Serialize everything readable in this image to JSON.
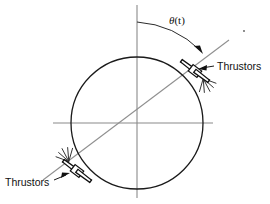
{
  "figure": {
    "type": "engineering-diagram"
  },
  "labels": {
    "angle_symbol": "θ",
    "angle_arg": "(t)",
    "angle_full": "θ(t)",
    "thruster_upper_right": "Thrustors",
    "thruster_lower_left": "Thrustors"
  },
  "colors": {
    "outline": "#111111",
    "axis": "#8a8a8a",
    "body_axis": "#8f8f8f",
    "background": "#ffffff",
    "arc": "#2b2b2b"
  },
  "geometry": {
    "circle": {
      "cx": 137,
      "cy": 123,
      "r": 66
    },
    "vertical_axis": {
      "x": 137,
      "y1": 5,
      "y2": 198
    },
    "horizontal_axis": {
      "y": 123,
      "x1": 53,
      "x2": 213
    },
    "body_axis": {
      "x1": 43,
      "y1": 180,
      "x2": 229,
      "y2": 40
    },
    "body_axis_angle_deg": 37,
    "arc": {
      "cx": 137,
      "cy": 123,
      "radius": 101,
      "start_deg": 90,
      "end_deg": 53
    },
    "thruster_upper_right": {
      "x": 196,
      "y": 72
    },
    "thruster_lower_left": {
      "x": 76,
      "y": 172
    }
  },
  "annotations": {
    "leader_upper_right": {
      "x1": 213,
      "y1": 66,
      "x2": 200,
      "y2": 69
    },
    "leader_lower_left": {
      "x1": 57,
      "y1": 178,
      "x2": 70,
      "y2": 174
    },
    "label_upper_right_pos": {
      "x": 216,
      "y": 70
    },
    "label_lower_left_pos": {
      "x": 4,
      "y": 186
    },
    "theta_pos": {
      "x": 169,
      "y": 24
    }
  }
}
